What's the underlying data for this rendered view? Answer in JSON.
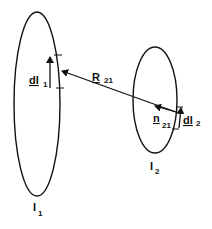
{
  "diagram": {
    "loop1": {
      "current_label": "I",
      "current_subscript": "1"
    },
    "loop2": {
      "current_label": "I",
      "current_subscript": "2"
    },
    "element1": {
      "label": "dl",
      "subscript": "1"
    },
    "element2": {
      "label": "dl",
      "subscript": "2"
    },
    "separation_vector": {
      "label": "R",
      "subscript": "21"
    },
    "unit_vector": {
      "label": "n",
      "subscript": "21"
    },
    "colors": {
      "stroke": "#111111",
      "background": "#ffffff"
    }
  }
}
